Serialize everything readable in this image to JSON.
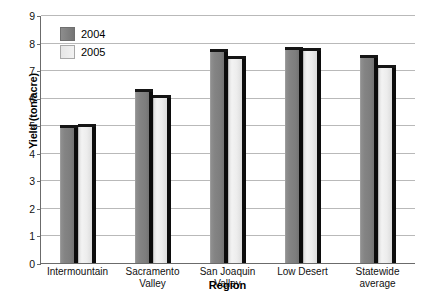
{
  "chart_data": {
    "type": "bar",
    "title": "",
    "xlabel": "Region",
    "ylabel": "Yield (ton/acre)",
    "ylim": [
      0,
      9
    ],
    "ytick_labels": [
      "0",
      "1",
      "2",
      "3",
      "4",
      "5",
      "6",
      "7",
      "8",
      "9"
    ],
    "grid": true,
    "legend_position": "top-left",
    "categories": [
      "Intermountain",
      "Sacramento Valley",
      "San Joaquin Valley",
      "Low Desert",
      "Statewide average"
    ],
    "category_lines": [
      [
        "Intermountain"
      ],
      [
        "Sacramento",
        "Valley"
      ],
      [
        "San Joaquin Valley"
      ],
      [
        "Low Desert"
      ],
      [
        "Statewide",
        "average"
      ]
    ],
    "series": [
      {
        "name": "2004",
        "color": "#808080",
        "values": [
          5.0,
          6.3,
          7.75,
          7.85,
          7.55
        ]
      },
      {
        "name": "2005",
        "color": "#ededed",
        "values": [
          5.05,
          6.1,
          7.5,
          7.8,
          7.2
        ]
      }
    ]
  }
}
